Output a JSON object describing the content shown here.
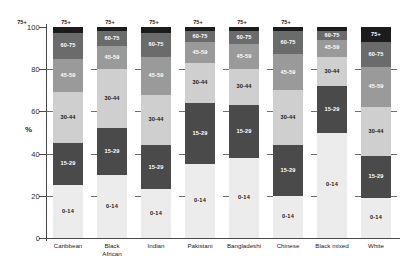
{
  "chart_data": {
    "type": "bar",
    "subtype": "stacked-bar-100",
    "title": "",
    "xlabel": "",
    "ylabel": "%",
    "ylim": [
      0,
      100
    ],
    "yticks": [
      "0",
      "20",
      "40",
      "60",
      "80",
      "100"
    ],
    "grid": false,
    "legend_position": "none",
    "legend_inline": true,
    "categories": [
      "Caribbean",
      "Black African",
      "Indian",
      "Pakistani",
      "Bangladeshi",
      "Chinese",
      "Black mixed",
      "White"
    ],
    "series": [
      {
        "name": "0-14",
        "color": "#ececec",
        "values": [
          25,
          30,
          23,
          35,
          38,
          20,
          50,
          19
        ]
      },
      {
        "name": "15-29",
        "color": "#4a4a4a",
        "values": [
          20,
          22,
          21,
          29,
          25,
          24,
          22,
          20
        ]
      },
      {
        "name": "30-44",
        "color": "#cfcfcf",
        "values": [
          24,
          28,
          24,
          19,
          17,
          26,
          14,
          23
        ]
      },
      {
        "name": "45-59",
        "color": "#9a9a9a",
        "values": [
          16,
          11,
          18,
          10,
          12,
          17,
          8,
          19
        ]
      },
      {
        "name": "60-75",
        "color": "#6b6b6b",
        "values": [
          12,
          7,
          11,
          5,
          6,
          11,
          4,
          12
        ]
      },
      {
        "name": "75+",
        "color": "#1c1c1c",
        "values": [
          3,
          2,
          3,
          2,
          2,
          2,
          2,
          7
        ]
      }
    ],
    "segment_labels": [
      "0-14",
      "15-29",
      "30-44",
      "45-59",
      "60-75",
      "75+"
    ],
    "colors": {
      "0-14": "#ececec",
      "15-29": "#4a4a4a",
      "30-44": "#cfcfcf",
      "45-59": "#9a9a9a",
      "60-75": "#6b6b6b",
      "75+": "#1c1c1c",
      "axis": "#4a4a4a",
      "background": "#ffffff"
    }
  }
}
